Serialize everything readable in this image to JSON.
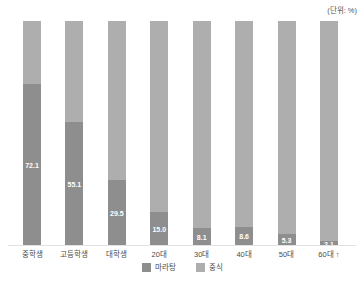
{
  "unit_label": "(단위: %)",
  "chart_data": {
    "type": "bar",
    "stacked": true,
    "orientation": "vertical",
    "title": "",
    "unit_label": "(단위: %)",
    "categories": [
      "중학생",
      "고등학생",
      "대학생",
      "20대",
      "30대",
      "40대",
      "50대",
      "60대 ↑"
    ],
    "series": [
      {
        "name": "마라탕",
        "color": "#8e8e8e",
        "values": [
          72.1,
          55.1,
          29.5,
          15.0,
          8.1,
          8.6,
          5.3,
          2.1
        ],
        "data_labels": [
          "72.1",
          "55.1",
          "29.5",
          "15.0",
          "8.1",
          "8.6",
          "5.3",
          "2.1"
        ],
        "show_labels": true
      },
      {
        "name": "중식",
        "color": "#aeaeae",
        "values": [
          27.9,
          44.9,
          70.5,
          85.0,
          91.9,
          91.4,
          94.7,
          97.9
        ],
        "show_labels": false
      }
    ],
    "ylim": [
      0,
      100
    ],
    "grid": false,
    "legend_position": "bottom",
    "value_label_color": "#ffffff",
    "axis_line_color": "#e2e2e2"
  }
}
